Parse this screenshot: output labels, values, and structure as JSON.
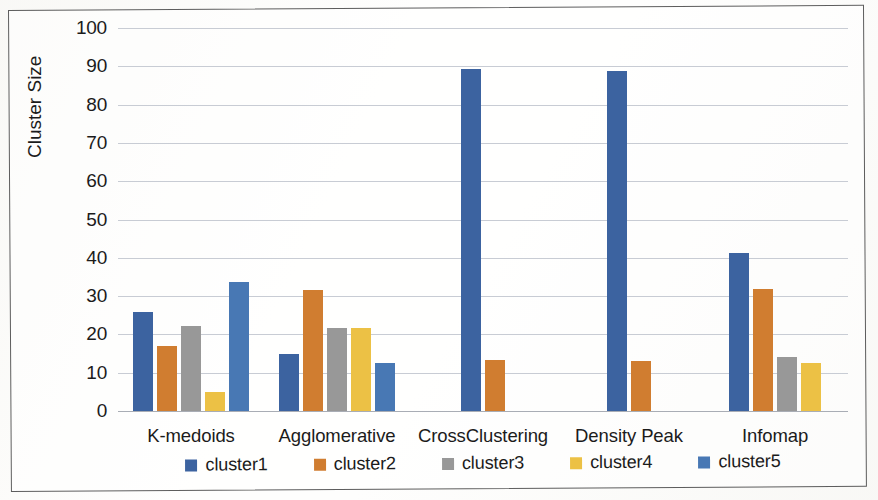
{
  "chart_data": {
    "type": "bar",
    "title": "",
    "subtitle": "",
    "xlabel": "",
    "ylabel": "Cluster Size",
    "ylim": [
      0,
      100
    ],
    "ytick_labels": [
      "100",
      "90",
      "80",
      "70",
      "60",
      "50",
      "40",
      "30",
      "20",
      "10",
      "0"
    ],
    "ytick_values": [
      100,
      90,
      80,
      70,
      60,
      50,
      40,
      30,
      20,
      10,
      0
    ],
    "grid": "horizontal",
    "legend_position": "bottom",
    "categories": [
      "K-medoids",
      "Agglomerative",
      "CrossClustering",
      "Density Peak",
      "Infomap"
    ],
    "series": [
      {
        "name": "cluster1",
        "color": "#3c63a0",
        "values": [
          25.8,
          15.0,
          89.4,
          88.8,
          41.2
        ]
      },
      {
        "name": "cluster2",
        "color": "#d07d30",
        "values": [
          16.9,
          31.6,
          13.3,
          13.0,
          31.9
        ]
      },
      {
        "name": "cluster3",
        "color": "#989898",
        "values": [
          22.2,
          21.8,
          null,
          null,
          14.0
        ]
      },
      {
        "name": "cluster4",
        "color": "#ecc145",
        "values": [
          5.0,
          21.7,
          null,
          null,
          12.6
        ]
      },
      {
        "name": "cluster5",
        "color": "#4878b4",
        "values": [
          33.8,
          12.5,
          null,
          null,
          null
        ]
      }
    ]
  }
}
